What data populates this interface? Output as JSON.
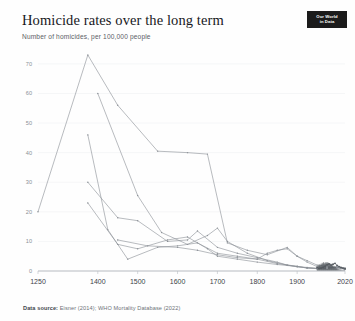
{
  "header": {
    "title": "Homicide rates over the long term",
    "subtitle": "Number of homicides, per 100,000 people",
    "logo_line1": "Our World",
    "logo_line2": "in Data"
  },
  "footer": {
    "source_label": "Data source:",
    "source_text": "Eisner (2014); WHO Mortality Database (2022)"
  },
  "colors": {
    "line": "#8c9197",
    "line_dark": "#53585e",
    "axis": "#b9bec3",
    "grid": "#eceef0",
    "tick_text": "#8b9096",
    "xtick_text": "#3d4248",
    "background": "#fefefe",
    "logo_bg": "#1b1b1b"
  },
  "chart_data": {
    "type": "line",
    "title": "Homicide rates over the long term",
    "subtitle": "Number of homicides, per 100,000 people",
    "xlabel": "",
    "ylabel": "Number of homicides, per 100,000 people",
    "xlim": [
      1250,
      2020
    ],
    "ylim": [
      0,
      73
    ],
    "grid": true,
    "legend_position": "none",
    "x_ticks": [
      1250,
      1400,
      1500,
      1600,
      1700,
      1800,
      1900,
      2020
    ],
    "x_tick_labels": [
      "1250",
      "1400",
      "1500",
      "1600",
      "1700",
      "1800",
      "1900",
      "2020"
    ],
    "y_ticks": [
      0,
      10,
      20,
      30,
      40,
      50,
      60,
      70
    ],
    "y_tick_labels": [
      "0",
      "10",
      "20",
      "30",
      "40",
      "50",
      "60",
      "70"
    ],
    "series": [
      {
        "name": "Italy",
        "points": [
          [
            1250,
            20.0
          ],
          [
            1375,
            73.0
          ],
          [
            1450,
            56.0
          ],
          [
            1550,
            40.5
          ],
          [
            1625,
            40.0
          ],
          [
            1675,
            39.5
          ],
          [
            1725,
            9.5
          ],
          [
            1775,
            7.0
          ],
          [
            1825,
            5.5
          ],
          [
            1875,
            8.0
          ],
          [
            1900,
            5.0
          ],
          [
            1925,
            3.5
          ],
          [
            1950,
            2.0
          ],
          [
            1975,
            1.6
          ],
          [
            2000,
            1.2
          ],
          [
            2020,
            0.6
          ]
        ]
      },
      {
        "name": "England",
        "points": [
          [
            1400,
            60.0
          ],
          [
            1500,
            25.5
          ],
          [
            1560,
            13.0
          ],
          [
            1625,
            9.0
          ],
          [
            1675,
            12.0
          ],
          [
            1700,
            14.5
          ],
          [
            1725,
            10.0
          ],
          [
            1775,
            6.0
          ],
          [
            1825,
            3.5
          ],
          [
            1875,
            2.0
          ],
          [
            1900,
            1.5
          ],
          [
            1925,
            1.0
          ],
          [
            1950,
            0.8
          ],
          [
            1975,
            1.0
          ],
          [
            2000,
            1.4
          ],
          [
            2020,
            1.0
          ]
        ]
      },
      {
        "name": "Netherlands and Belgium",
        "points": [
          [
            1375,
            46.0
          ],
          [
            1425,
            14.0
          ],
          [
            1475,
            4.0
          ],
          [
            1550,
            8.0
          ],
          [
            1600,
            8.5
          ],
          [
            1650,
            9.5
          ],
          [
            1700,
            6.0
          ],
          [
            1750,
            5.0
          ],
          [
            1800,
            4.0
          ],
          [
            1850,
            2.5
          ],
          [
            1900,
            1.6
          ],
          [
            1925,
            1.0
          ],
          [
            1950,
            0.8
          ],
          [
            1975,
            0.9
          ],
          [
            2000,
            1.2
          ],
          [
            2020,
            0.7
          ]
        ]
      },
      {
        "name": "Germany and Switzerland",
        "points": [
          [
            1375,
            30.0
          ],
          [
            1450,
            18.0
          ],
          [
            1500,
            17.0
          ],
          [
            1575,
            10.0
          ],
          [
            1625,
            10.5
          ],
          [
            1650,
            13.5
          ],
          [
            1700,
            8.0
          ],
          [
            1750,
            6.0
          ],
          [
            1800,
            4.5
          ],
          [
            1850,
            3.0
          ],
          [
            1875,
            2.0
          ],
          [
            1900,
            1.4
          ],
          [
            1925,
            1.1
          ],
          [
            1950,
            0.9
          ],
          [
            1975,
            1.0
          ],
          [
            2000,
            1.1
          ],
          [
            2020,
            0.6
          ]
        ]
      },
      {
        "name": "Scandinavia",
        "points": [
          [
            1375,
            23.0
          ],
          [
            1450,
            9.0
          ],
          [
            1500,
            7.5
          ],
          [
            1575,
            10.5
          ],
          [
            1625,
            11.5
          ],
          [
            1675,
            7.5
          ],
          [
            1700,
            5.0
          ],
          [
            1750,
            4.0
          ],
          [
            1800,
            3.0
          ],
          [
            1850,
            2.2
          ],
          [
            1900,
            1.5
          ],
          [
            1925,
            1.2
          ],
          [
            1950,
            0.9
          ],
          [
            1975,
            1.1
          ],
          [
            2000,
            1.3
          ],
          [
            2020,
            0.9
          ]
        ]
      },
      {
        "name": "Spain",
        "points": [
          [
            1450,
            10.5
          ],
          [
            1525,
            8.5
          ],
          [
            1600,
            8.0
          ],
          [
            1650,
            7.0
          ],
          [
            1700,
            5.5
          ],
          [
            1750,
            4.5
          ],
          [
            1800,
            4.0
          ],
          [
            1825,
            6.0
          ],
          [
            1850,
            7.0
          ],
          [
            1875,
            7.5
          ],
          [
            1900,
            5.0
          ],
          [
            1925,
            3.0
          ],
          [
            1950,
            1.5
          ],
          [
            1975,
            1.0
          ],
          [
            2000,
            1.2
          ],
          [
            2020,
            0.7
          ]
        ]
      },
      {
        "name": "Modern annual records",
        "points": [
          [
            1950,
            1.1
          ],
          [
            1955,
            0.9
          ],
          [
            1960,
            1.0
          ],
          [
            1965,
            1.3
          ],
          [
            1970,
            1.6
          ],
          [
            1975,
            2.1
          ],
          [
            1980,
            2.4
          ],
          [
            1985,
            2.0
          ],
          [
            1990,
            2.3
          ],
          [
            1995,
            2.6
          ],
          [
            2000,
            1.9
          ],
          [
            2005,
            1.5
          ],
          [
            2010,
            1.2
          ],
          [
            2015,
            1.0
          ],
          [
            2020,
            0.8
          ]
        ]
      }
    ]
  }
}
